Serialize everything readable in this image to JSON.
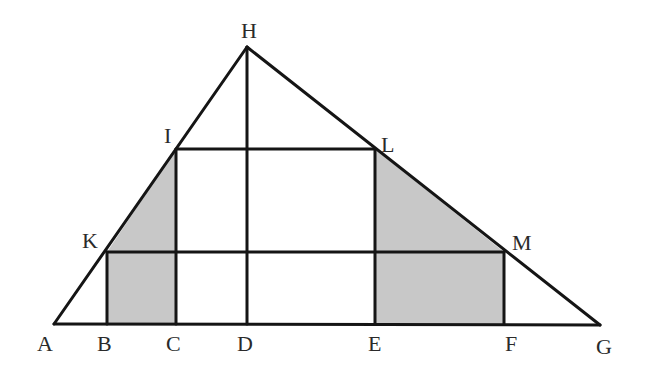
{
  "figure": {
    "type": "geometry-diagram",
    "colors": {
      "line": "#151515",
      "shade": "#c8c8c8",
      "background": "#ffffff",
      "label": "#2a2a2a"
    },
    "points": {
      "A": {
        "label": "A",
        "x": 54,
        "y": 324
      },
      "B": {
        "label": "B",
        "x": 107,
        "y": 324
      },
      "C": {
        "label": "C",
        "x": 176,
        "y": 324
      },
      "D": {
        "label": "D",
        "x": 247,
        "y": 324
      },
      "E": {
        "label": "E",
        "x": 375,
        "y": 324
      },
      "F": {
        "label": "F",
        "x": 504,
        "y": 324
      },
      "G": {
        "label": "G",
        "x": 600,
        "y": 325
      },
      "H": {
        "label": "H",
        "x": 247,
        "y": 47
      },
      "I": {
        "label": "I",
        "x": 176,
        "y": 149
      },
      "L": {
        "label": "L",
        "x": 375,
        "y": 149
      },
      "K": {
        "label": "K",
        "x": 107,
        "y": 252
      },
      "M": {
        "label": "M",
        "x": 504,
        "y": 252
      }
    },
    "segments": [
      [
        "A",
        "G"
      ],
      [
        "A",
        "H"
      ],
      [
        "H",
        "G"
      ],
      [
        "H",
        "D"
      ],
      [
        "I",
        "L"
      ],
      [
        "K",
        "M"
      ],
      [
        "I",
        "C"
      ],
      [
        "L",
        "E"
      ],
      [
        "K",
        "B"
      ],
      [
        "M",
        "F"
      ]
    ],
    "shaded_regions": [
      [
        "K",
        "I",
        "C",
        "B"
      ],
      [
        "L",
        "M",
        "F",
        "E"
      ]
    ],
    "labels": {
      "H": {
        "text": "H",
        "x": 241,
        "y": 38
      },
      "I": {
        "text": "I",
        "x": 164,
        "y": 143
      },
      "L": {
        "text": "L",
        "x": 381,
        "y": 152
      },
      "K": {
        "text": "K",
        "x": 82,
        "y": 248
      },
      "M": {
        "text": "M",
        "x": 512,
        "y": 250
      },
      "A": {
        "text": "A",
        "x": 37,
        "y": 351
      },
      "B": {
        "text": "B",
        "x": 97,
        "y": 351
      },
      "C": {
        "text": "C",
        "x": 166,
        "y": 351
      },
      "D": {
        "text": "D",
        "x": 237,
        "y": 351
      },
      "E": {
        "text": "E",
        "x": 368,
        "y": 351
      },
      "F": {
        "text": "F",
        "x": 505,
        "y": 351
      },
      "G": {
        "text": "G",
        "x": 596,
        "y": 354
      }
    }
  }
}
